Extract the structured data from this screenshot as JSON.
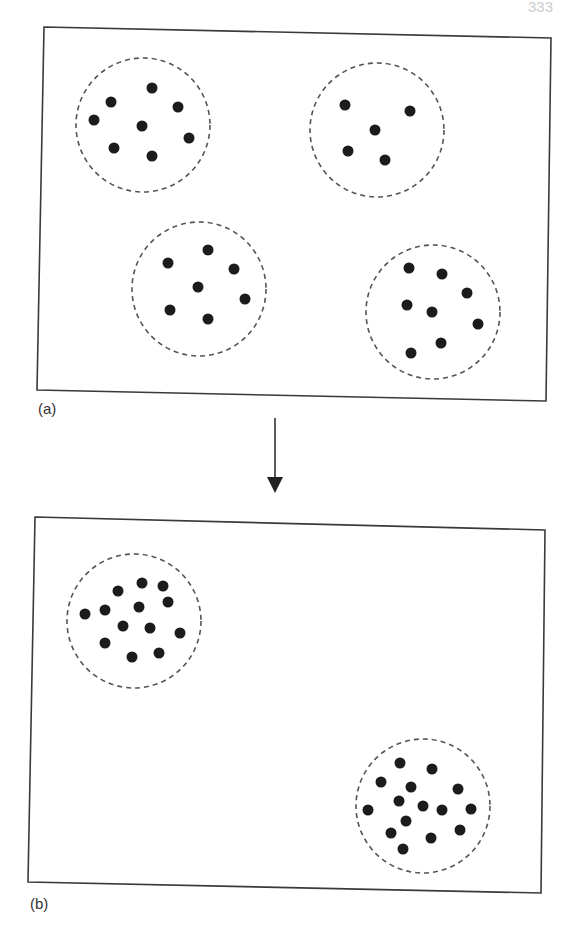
{
  "page_number": "333",
  "panel_a": {
    "label": "(a)",
    "frame": [
      [
        44,
        27
      ],
      [
        551,
        38
      ],
      [
        546,
        401
      ],
      [
        37,
        390
      ]
    ],
    "clusters": [
      {
        "cx": 143,
        "cy": 125,
        "r": 67,
        "dots": [
          [
            152,
            88
          ],
          [
            111,
            102
          ],
          [
            178,
            107
          ],
          [
            94,
            120
          ],
          [
            142,
            126
          ],
          [
            189,
            138
          ],
          [
            114,
            148
          ],
          [
            152,
            156
          ]
        ]
      },
      {
        "cx": 377,
        "cy": 130,
        "r": 67,
        "dots": [
          [
            345,
            105
          ],
          [
            410,
            111
          ],
          [
            375,
            130
          ],
          [
            348,
            151
          ],
          [
            385,
            160
          ]
        ]
      },
      {
        "cx": 199,
        "cy": 289,
        "r": 67,
        "dots": [
          [
            208,
            250
          ],
          [
            168,
            263
          ],
          [
            234,
            269
          ],
          [
            198,
            287
          ],
          [
            245,
            299
          ],
          [
            170,
            310
          ],
          [
            208,
            319
          ]
        ]
      },
      {
        "cx": 433,
        "cy": 312,
        "r": 67,
        "dots": [
          [
            409,
            268
          ],
          [
            442,
            274
          ],
          [
            467,
            293
          ],
          [
            407,
            305
          ],
          [
            432,
            312
          ],
          [
            478,
            324
          ],
          [
            441,
            343
          ],
          [
            411,
            353
          ]
        ]
      }
    ]
  },
  "arrow": {
    "x": 275,
    "y1": 418,
    "y2": 493,
    "direction": "down"
  },
  "panel_b": {
    "label": "(b)",
    "frame": [
      [
        35,
        517
      ],
      [
        545,
        530
      ],
      [
        541,
        893
      ],
      [
        28,
        882
      ]
    ],
    "clusters": [
      {
        "cx": 134,
        "cy": 621,
        "r": 67,
        "dots": [
          [
            142,
            583
          ],
          [
            163,
            586
          ],
          [
            118,
            591
          ],
          [
            168,
            602
          ],
          [
            85,
            614
          ],
          [
            105,
            610
          ],
          [
            139,
            607
          ],
          [
            123,
            626
          ],
          [
            150,
            628
          ],
          [
            180,
            633
          ],
          [
            105,
            643
          ],
          [
            132,
            657
          ],
          [
            159,
            653
          ]
        ]
      },
      {
        "cx": 423,
        "cy": 806,
        "r": 67,
        "dots": [
          [
            400,
            763
          ],
          [
            432,
            769
          ],
          [
            381,
            782
          ],
          [
            411,
            787
          ],
          [
            458,
            789
          ],
          [
            399,
            801
          ],
          [
            423,
            806
          ],
          [
            442,
            810
          ],
          [
            471,
            809
          ],
          [
            368,
            810
          ],
          [
            406,
            821
          ],
          [
            391,
            833
          ],
          [
            431,
            838
          ],
          [
            460,
            830
          ],
          [
            403,
            849
          ]
        ]
      }
    ]
  },
  "colors": {
    "dot": "#1c1c1c",
    "frame": "#3a3a3a",
    "ring": "#555555"
  }
}
